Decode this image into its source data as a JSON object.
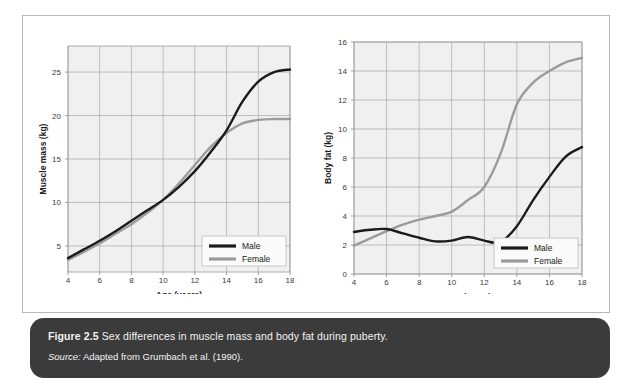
{
  "figure": {
    "caption_label": "Figure 2.5",
    "caption_text": "Sex differences in muscle mass and body fat during puberty.",
    "source_label": "Source:",
    "source_text": "Adapted from Grumbach et al. (1990)."
  },
  "colors": {
    "male": "#1b1b1b",
    "female": "#9b9b9b",
    "plot_background": "#f0f0f0",
    "grid": "#a8a8a8",
    "caption_bar": "#3b3b3b",
    "frame": "#b9b9b9"
  },
  "chart_data": [
    {
      "type": "line",
      "title": "",
      "xlabel": "Age (years)",
      "ylabel": "Muscle mass (kg)",
      "xlim": [
        4,
        18
      ],
      "ylim": [
        2,
        28
      ],
      "xticks": [
        4,
        6,
        8,
        10,
        12,
        14,
        16,
        18
      ],
      "yticks": [
        5,
        10,
        15,
        20,
        25
      ],
      "grid": true,
      "legend_position": "bottom-right",
      "x": [
        4,
        5,
        6,
        7,
        8,
        9,
        10,
        11,
        12,
        13,
        14,
        15,
        16,
        17,
        18
      ],
      "series": [
        {
          "name": "Male",
          "color": "#1b1b1b",
          "values": [
            3.6,
            4.6,
            5.6,
            6.7,
            7.9,
            9.1,
            10.3,
            11.8,
            13.6,
            15.8,
            18.3,
            21.6,
            23.9,
            25.0,
            25.3
          ]
        },
        {
          "name": "Female",
          "color": "#9b9b9b",
          "values": [
            3.4,
            4.3,
            5.3,
            6.4,
            7.5,
            8.8,
            10.3,
            12.2,
            14.3,
            16.4,
            18.0,
            19.1,
            19.5,
            19.6,
            19.6
          ]
        }
      ]
    },
    {
      "type": "line",
      "title": "",
      "xlabel": "Age (years)",
      "ylabel": "Body fat (kg)",
      "xlim": [
        4,
        18
      ],
      "ylim": [
        0,
        16
      ],
      "xticks": [
        4,
        6,
        8,
        10,
        12,
        14,
        16,
        18
      ],
      "yticks": [
        0,
        2,
        4,
        6,
        8,
        10,
        12,
        14,
        16
      ],
      "grid": true,
      "legend_position": "bottom-right",
      "x": [
        4,
        5,
        6,
        7,
        8,
        9,
        10,
        11,
        12,
        13,
        14,
        15,
        16,
        17,
        18
      ],
      "series": [
        {
          "name": "Male",
          "color": "#1b1b1b",
          "values": [
            2.9,
            3.05,
            3.1,
            2.8,
            2.5,
            2.25,
            2.3,
            2.55,
            2.3,
            2.2,
            3.3,
            5.1,
            6.7,
            8.1,
            8.75
          ]
        },
        {
          "name": "Female",
          "color": "#9b9b9b",
          "values": [
            1.95,
            2.45,
            2.95,
            3.4,
            3.75,
            4.0,
            4.3,
            5.1,
            6.0,
            8.3,
            11.7,
            13.2,
            14.0,
            14.6,
            14.9
          ]
        }
      ]
    }
  ],
  "legend": {
    "male_label": "Male",
    "female_label": "Female"
  }
}
